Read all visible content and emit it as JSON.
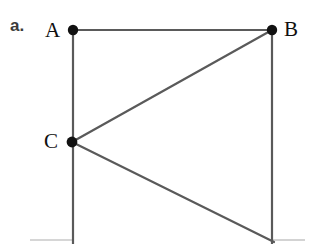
{
  "figure": {
    "part_label": "a.",
    "canvas": {
      "width": 314,
      "height": 244
    },
    "background_color": "#ffffff",
    "stroke_color": "#5a5a5a",
    "faint_stroke_color": "#c9c9c9",
    "vertex_color": "#111111",
    "label_color": "#101010",
    "part_label_color": "#3b3b3b",
    "stroke_width": 2.1,
    "vertex_radius": 5.2,
    "vertices": [
      {
        "id": "A",
        "label": "A",
        "x": 73,
        "y": 30,
        "label_x": 45,
        "label_y": 20
      },
      {
        "id": "B",
        "label": "B",
        "x": 272,
        "y": 30,
        "label_x": 284,
        "label_y": 19
      },
      {
        "id": "C",
        "label": "C",
        "x": 72,
        "y": 142,
        "label_x": 44,
        "label_y": 131
      }
    ],
    "edges": [
      {
        "id": "AB",
        "from": "A",
        "to": "B",
        "x1": 73,
        "y1": 30,
        "x2": 272,
        "y2": 30,
        "style": "solid"
      },
      {
        "id": "A-down",
        "from": "A",
        "to": "bottom-left",
        "x1": 73,
        "y1": 30,
        "x2": 73,
        "y2": 244,
        "style": "solid"
      },
      {
        "id": "B-down",
        "from": "B",
        "to": "bottom-right",
        "x1": 272,
        "y1": 30,
        "x2": 272,
        "y2": 244,
        "style": "solid"
      },
      {
        "id": "BC",
        "from": "B",
        "to": "C",
        "x1": 272,
        "y1": 30,
        "x2": 72,
        "y2": 142,
        "style": "solid"
      },
      {
        "id": "C-bottomright",
        "from": "C",
        "to": "bottom-right",
        "x1": 72,
        "y1": 142,
        "x2": 274,
        "y2": 242,
        "style": "solid"
      }
    ],
    "cropped_edges": [
      {
        "id": "bottom-left-fragment",
        "x1": 30,
        "y1": 240,
        "x2": 72,
        "y2": 240,
        "style": "faint"
      },
      {
        "id": "bottom-right-fragment",
        "x1": 273,
        "y1": 240,
        "x2": 305,
        "y2": 240,
        "style": "faint"
      }
    ]
  }
}
